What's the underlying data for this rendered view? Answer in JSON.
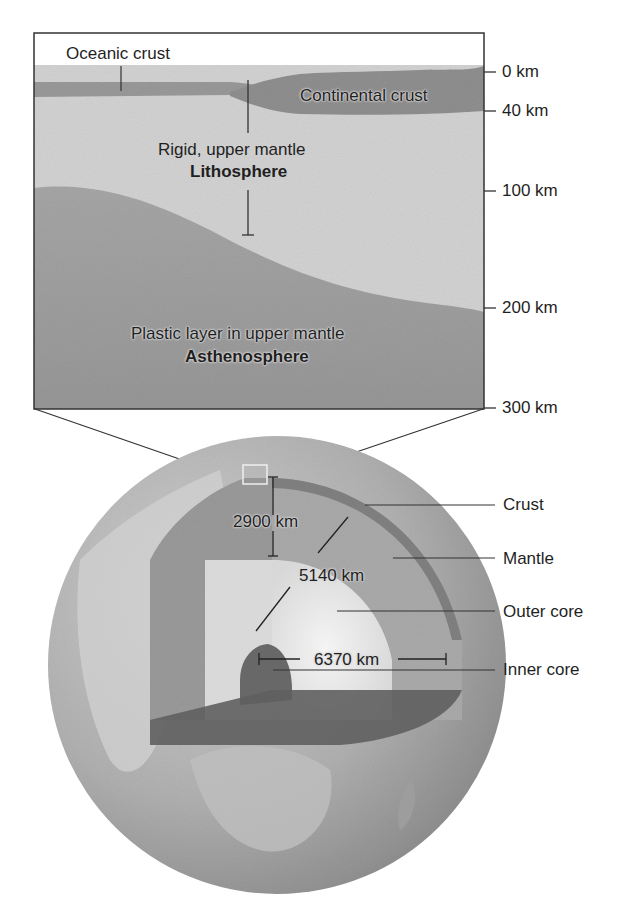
{
  "inset": {
    "oceanic_crust": "Oceanic crust",
    "continental_crust": "Continental crust",
    "lithosphere_desc": "Rigid, upper mantle",
    "lithosphere_name": "Lithosphere",
    "asthenosphere_desc": "Plastic layer in upper mantle",
    "asthenosphere_name": "Asthenosphere",
    "depth_scale": [
      {
        "label": "0 km",
        "y": 72
      },
      {
        "label": "40 km",
        "y": 111
      },
      {
        "label": "100 km",
        "y": 191
      },
      {
        "label": "200 km",
        "y": 308
      },
      {
        "label": "300 km",
        "y": 408
      }
    ]
  },
  "globe": {
    "dimensions": {
      "mantle_thickness": "2900 km",
      "core_boundary_radius": "5140 km",
      "earth_radius": "6370 km"
    },
    "layers": [
      {
        "label": "Crust"
      },
      {
        "label": "Mantle"
      },
      {
        "label": "Outer core"
      },
      {
        "label": "Inner core"
      }
    ]
  },
  "colors": {
    "frame": "#333333",
    "sky": "#ffffff",
    "crust": "#8f8f8f",
    "lithosphere": "#cfcfcf",
    "asthenosphere": "#9e9e9e",
    "globe_surface": "#a8a8a8",
    "mantle": "#a0a0a0",
    "outer_core": "#e6e6e6",
    "inner_core": "#6e6e6e"
  }
}
